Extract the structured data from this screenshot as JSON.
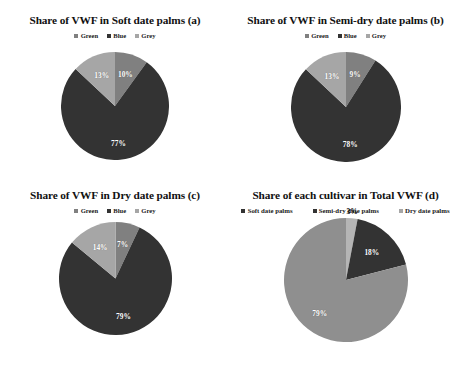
{
  "charts": [
    {
      "id": "a",
      "title": "Share of  VWF in Soft date palms (a)",
      "legend": [
        {
          "label": "Green",
          "color": "#808080"
        },
        {
          "label": "Blue",
          "color": "#333333"
        },
        {
          "label": "Grey",
          "color": "#a6a6a6"
        }
      ],
      "chart_data": {
        "type": "pie",
        "title": "Share of  VWF in Soft date palms (a)",
        "categories": [
          "Green",
          "Blue",
          "Grey"
        ],
        "values": [
          10,
          77,
          13
        ],
        "labels": [
          "10%",
          "77%",
          "13%"
        ],
        "colors": [
          "#808080",
          "#333333",
          "#a6a6a6"
        ],
        "legend_position": "top"
      }
    },
    {
      "id": "b",
      "title": "Share of  VWF in Semi-dry date palms (b)",
      "legend": [
        {
          "label": "Green",
          "color": "#808080"
        },
        {
          "label": "Blue",
          "color": "#333333"
        },
        {
          "label": "Grey",
          "color": "#a6a6a6"
        }
      ],
      "chart_data": {
        "type": "pie",
        "title": "Share of  VWF in Semi-dry date palms (b)",
        "categories": [
          "Green",
          "Blue",
          "Grey"
        ],
        "values": [
          9,
          78,
          13
        ],
        "labels": [
          "9%",
          "78%",
          "13%"
        ],
        "colors": [
          "#808080",
          "#333333",
          "#a6a6a6"
        ],
        "legend_position": "top"
      }
    },
    {
      "id": "c",
      "title": "Share of  VWF in Dry date palms  (c)",
      "legend": [
        {
          "label": "Green",
          "color": "#808080"
        },
        {
          "label": "Blue",
          "color": "#333333"
        },
        {
          "label": "Grey",
          "color": "#a6a6a6"
        }
      ],
      "chart_data": {
        "type": "pie",
        "title": "Share of  VWF in Dry date palms  (c)",
        "categories": [
          "Green",
          "Blue",
          "Grey"
        ],
        "values": [
          7,
          79,
          14
        ],
        "labels": [
          "7%",
          "79%",
          "14%"
        ],
        "colors": [
          "#808080",
          "#333333",
          "#a6a6a6"
        ],
        "legend_position": "top"
      }
    },
    {
      "id": "d",
      "title": "Share of  each cultivar  in Total VWF (d)",
      "legend": [
        {
          "label": "Soft date palms",
          "color": "#333333"
        },
        {
          "label": "Semi-dry date palms",
          "color": "#333333"
        },
        {
          "label": "Dry date palms",
          "color": "#a6a6a6"
        }
      ],
      "chart_data": {
        "type": "pie",
        "title": "Share of  each cultivar  in Total VWF (d)",
        "categories": [
          "Soft date palms",
          "Semi-dry date palms",
          "Dry date palms"
        ],
        "values": [
          3,
          18,
          79
        ],
        "labels": [
          "3%",
          "18%",
          "79%"
        ],
        "colors": [
          "#b5b5b5",
          "#333333",
          "#8f8f8f"
        ],
        "legend_position": "top"
      }
    }
  ]
}
